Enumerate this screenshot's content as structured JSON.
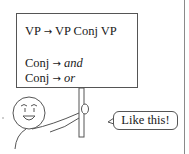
{
  "sign": {
    "rules": [
      {
        "lhs": "VP",
        "arrow": "→",
        "rhs": "VP Conj VP",
        "rhs_italic": false
      },
      {
        "lhs": "Conj",
        "arrow": "→",
        "rhs": "and",
        "rhs_italic": true
      },
      {
        "lhs": "Conj",
        "arrow": "→",
        "rhs": "or",
        "rhs_italic": true
      }
    ]
  },
  "speech_bubble": {
    "text": "Like this!"
  },
  "colors": {
    "stroke": "#555555",
    "text": "#1a1a1a",
    "background": "#ffffff",
    "divider": "#8a8a8a"
  },
  "icons": {
    "figure": "stick-figure-holding-sign"
  }
}
